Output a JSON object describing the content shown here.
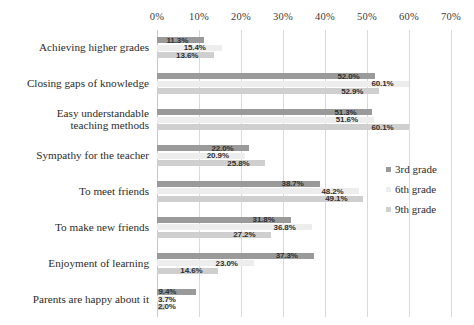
{
  "chart_data": {
    "type": "bar",
    "orientation": "horizontal",
    "title": "",
    "subtitle": "",
    "xlabel": "",
    "ylabel": "",
    "xlim": [
      0,
      70
    ],
    "xtick_labels": [
      "0%",
      "10%",
      "20%",
      "30%",
      "40%",
      "50%",
      "60%",
      "70%"
    ],
    "xtick_values": [
      0,
      10,
      20,
      30,
      40,
      50,
      60,
      70
    ],
    "grid": true,
    "legend_position": "right-middle",
    "categories": [
      "Achieving higher grades",
      "Closing gaps of knowledge",
      "Easy understandable\nteaching methods",
      "Sympathy for the teacher",
      "To meet friends",
      "To make new friends",
      "Enjoyment of learning",
      "Parents are happy about it"
    ],
    "series": [
      {
        "name": "3rd grade",
        "color": "#9a9a9a",
        "values": [
          11.3,
          52.0,
          51.3,
          22.0,
          38.7,
          31.8,
          37.3,
          9.4
        ],
        "labels": [
          "11.3%",
          "52.0%",
          "51.3%",
          "22.0%",
          "38.7%",
          "31.8%",
          "37.3%",
          "9.4%"
        ]
      },
      {
        "name": "6th grade",
        "color": "#ededed",
        "values": [
          15.4,
          60.1,
          51.6,
          20.9,
          48.2,
          36.8,
          23.0,
          3.7
        ],
        "labels": [
          "15.4%",
          "60.1%",
          "51.6%",
          "20.9%",
          "48.2%",
          "36.8%",
          "23.0%",
          "3.7%"
        ]
      },
      {
        "name": "9th grade",
        "color": "#cfcfcf",
        "values": [
          13.6,
          52.9,
          60.1,
          25.8,
          49.1,
          27.2,
          14.6,
          2.0
        ],
        "labels": [
          "13.6%",
          "52.9%",
          "60.1%",
          "25.8%",
          "49.1%",
          "27.2%",
          "14.6%",
          "2.0%"
        ]
      }
    ]
  },
  "legend": {
    "items": [
      {
        "label": "3rd grade"
      },
      {
        "label": "6th grade"
      },
      {
        "label": "9th grade"
      }
    ]
  }
}
